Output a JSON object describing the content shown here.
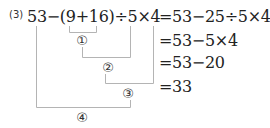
{
  "problem": {
    "number": "(3)",
    "expression": "53−(9+16)÷5×4"
  },
  "steps": [
    "=53−25÷5×4",
    "=53−5×4",
    "=53−20",
    "=33"
  ],
  "order_labels": [
    "①",
    "②",
    "③",
    "④"
  ],
  "colors": {
    "text": "#222222",
    "bracket_lines": "#b0b0b0"
  }
}
